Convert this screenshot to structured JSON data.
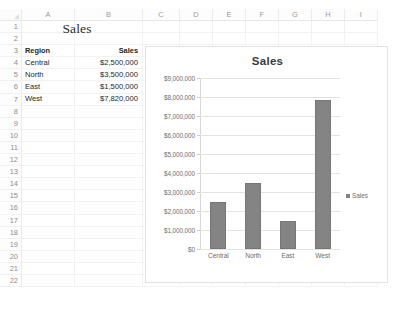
{
  "spreadsheet": {
    "columns": [
      "A",
      "B",
      "C",
      "D",
      "E",
      "F",
      "G",
      "H",
      "I"
    ],
    "rows": [
      "1",
      "2",
      "3",
      "4",
      "5",
      "6",
      "7",
      "8",
      "9",
      "10",
      "11",
      "12",
      "13",
      "14",
      "15",
      "16",
      "17",
      "18",
      "19",
      "20",
      "21",
      "22"
    ],
    "title_cell": "Sales",
    "header_region": "Region",
    "header_sales": "Sales",
    "data": [
      {
        "region": "Central",
        "sales": "$2,500,000"
      },
      {
        "region": "North",
        "sales": "$3,500,000"
      },
      {
        "region": "East",
        "sales": "$1,500,000"
      },
      {
        "region": "West",
        "sales": "$7,820,000"
      }
    ]
  },
  "chart_data": {
    "type": "bar",
    "title": "Sales",
    "categories": [
      "Central",
      "North",
      "East",
      "West"
    ],
    "values": [
      2500000,
      3500000,
      1500000,
      7820000
    ],
    "series": [
      {
        "name": "Sales",
        "values": [
          2500000,
          3500000,
          1500000,
          7820000
        ]
      }
    ],
    "xlabel": "",
    "ylabel": "",
    "ylim": [
      0,
      9000000
    ],
    "ytick_labels": [
      "$9,000,000",
      "$8,000,000",
      "$7,000,000",
      "$6,000,000",
      "$5,000,000",
      "$4,000,000",
      "$3,000,000",
      "$2,000,000",
      "$1,000,000",
      "$0"
    ],
    "ytick_values": [
      9000000,
      8000000,
      7000000,
      6000000,
      5000000,
      4000000,
      3000000,
      2000000,
      1000000,
      0
    ],
    "grid": true,
    "legend": [
      "Sales"
    ],
    "legend_position": "right",
    "bar_color": "#848484"
  }
}
